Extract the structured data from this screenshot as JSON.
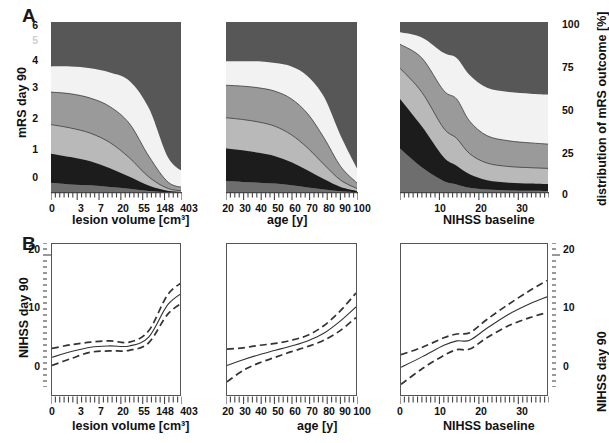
{
  "figure": {
    "panels": [
      {
        "letter": "A"
      },
      {
        "letter": "B"
      }
    ]
  },
  "panelA": {
    "letter": "A",
    "ylabel_left": "mRS day 90",
    "ylabel_right": "distribution of mRS outcome [%]",
    "ytick_left": [
      "6",
      "5",
      "4",
      "3",
      "2",
      "1",
      "0"
    ],
    "ytick_right": [
      "100",
      "75",
      "50",
      "25",
      "0"
    ],
    "subplots": [
      {
        "xlabel": "lesion volume [cm³]",
        "xticks": [
          "0",
          "3",
          "7",
          "20",
          "55",
          "148",
          "403"
        ]
      },
      {
        "xlabel": "age [y]",
        "xticks": [
          "20",
          "30",
          "40",
          "50",
          "60",
          "70",
          "80",
          "90",
          "100"
        ]
      },
      {
        "xlabel": "NIHSS baseline",
        "xticks": [
          "10",
          "20",
          "30"
        ]
      }
    ]
  },
  "panelB": {
    "letter": "B",
    "ylabel_left": "NIHSS day 90",
    "ylabel_right": "NIHSS day 90",
    "ytick_left": [
      "20",
      "10",
      "0"
    ],
    "ytick_right": [
      "20",
      "10",
      "0"
    ],
    "subplots": [
      {
        "xlabel": "lesion volume [cm³]",
        "xticks": [
          "0",
          "3",
          "7",
          "20",
          "55",
          "148",
          "403"
        ]
      },
      {
        "xlabel": "age [y]",
        "xticks": [
          "20",
          "30",
          "40",
          "50",
          "60",
          "70",
          "80",
          "90",
          "100"
        ]
      },
      {
        "xlabel": "NIHSS baseline",
        "xticks": [
          "0",
          "10",
          "20",
          "30"
        ]
      }
    ]
  },
  "colors": {
    "mrs0": "#6e6e6e",
    "mrs1": "#5a5a5a",
    "mrs2": "#1c1c1c",
    "mrs3": "#b9b9b9",
    "mrs4": "#9a9a9a",
    "mrs5": "#f2f2f2",
    "mrs6": "#575757",
    "frame": "#555555",
    "line": "#333333"
  },
  "chart_data": [
    {
      "id": "A1",
      "type": "area",
      "stacked": true,
      "title": "",
      "xlabel": "lesion volume [cm³]",
      "ylabel": "distribution of mRS outcome [%]",
      "xticks": [
        0,
        3,
        7,
        20,
        55,
        148,
        403
      ],
      "xscale": "log-like",
      "ylim": [
        0,
        100
      ],
      "yticks": [
        0,
        25,
        50,
        75,
        100
      ],
      "x": [
        0,
        3,
        7,
        20,
        55,
        148,
        403,
        700
      ],
      "series": [
        {
          "name": "mRS 0",
          "values": [
            6,
            5,
            4.5,
            3.5,
            2.5,
            1.2,
            0.4,
            0.2
          ]
        },
        {
          "name": "mRS 1",
          "values": [
            17,
            16,
            14,
            11,
            7,
            3,
            0.8,
            0.4
          ]
        },
        {
          "name": "mRS 2",
          "values": [
            17,
            17,
            16.5,
            15,
            11,
            5,
            1.3,
            0.6
          ]
        },
        {
          "name": "mRS 3",
          "values": [
            19,
            20,
            20.5,
            21,
            20,
            12,
            3.5,
            1.8
          ]
        },
        {
          "name": "mRS 4",
          "values": [
            15,
            16,
            17.5,
            20,
            25,
            28,
            14,
            8
          ]
        },
        {
          "name": "mRS 5",
          "values": [
            2.5,
            3,
            3.5,
            4.5,
            6.5,
            9,
            7,
            5
          ]
        },
        {
          "name": "mRS 6",
          "values": [
            23.5,
            23,
            23.5,
            25,
            28,
            41.8,
            73,
            84
          ]
        }
      ]
    },
    {
      "id": "A2",
      "type": "area",
      "stacked": true,
      "title": "",
      "xlabel": "age [y]",
      "ylabel": "distribution of mRS outcome [%]",
      "xticks": [
        20,
        30,
        40,
        50,
        60,
        70,
        80,
        90,
        100
      ],
      "xscale": "linear",
      "ylim": [
        0,
        100
      ],
      "yticks": [
        0,
        25,
        50,
        75,
        100
      ],
      "x": [
        20,
        30,
        40,
        50,
        60,
        70,
        80,
        90,
        100
      ],
      "series": [
        {
          "name": "mRS 0",
          "values": [
            7,
            6.5,
            6,
            5.5,
            4.5,
            3.2,
            2.0,
            1.0,
            0.4
          ]
        },
        {
          "name": "mRS 1",
          "values": [
            19,
            18.5,
            17.5,
            16,
            13.5,
            10,
            6,
            2.5,
            0.8
          ]
        },
        {
          "name": "mRS 2",
          "values": [
            18,
            18,
            18,
            17.5,
            16,
            13,
            8.5,
            4,
            1.4
          ]
        },
        {
          "name": "mRS 3",
          "values": [
            19,
            19.5,
            20,
            20.5,
            21,
            20,
            15.5,
            8,
            3.2
          ]
        },
        {
          "name": "mRS 4",
          "values": [
            14,
            14.5,
            15.5,
            16.5,
            19,
            22,
            24,
            18,
            8.5
          ]
        },
        {
          "name": "mRS 5",
          "values": [
            2.2,
            2.4,
            2.7,
            3.1,
            4.0,
            5.4,
            7.5,
            8.5,
            5.5
          ]
        },
        {
          "name": "mRS 6",
          "values": [
            20.8,
            20.6,
            20.3,
            20.9,
            22,
            26.4,
            36.5,
            58,
            80.2
          ]
        }
      ]
    },
    {
      "id": "A3",
      "type": "area",
      "stacked": true,
      "title": "",
      "xlabel": "NIHSS baseline",
      "ylabel": "distribution of mRS outcome [%]",
      "xticks": [
        10,
        20,
        30
      ],
      "xscale": "linear",
      "ylim": [
        0,
        100
      ],
      "yticks": [
        0,
        25,
        50,
        75,
        100
      ],
      "x": [
        0,
        5,
        10,
        13,
        16,
        20,
        25,
        30,
        34
      ],
      "series": [
        {
          "name": "mRS 0",
          "values": [
            26,
            15,
            7,
            5,
            3,
            2,
            1.5,
            1.3,
            1.2
          ]
        },
        {
          "name": "mRS 1",
          "values": [
            29,
            24,
            14,
            11,
            8,
            5.5,
            4.5,
            4.2,
            4.0
          ]
        },
        {
          "name": "mRS 2",
          "values": [
            18,
            20,
            17,
            16,
            12,
            10,
            9.5,
            9.3,
            9.2
          ]
        },
        {
          "name": "mRS 3",
          "values": [
            14,
            20,
            22,
            23,
            19,
            16,
            15,
            14.5,
            14.2
          ]
        },
        {
          "name": "mRS 4",
          "values": [
            7,
            12,
            22,
            24,
            27,
            28,
            28.5,
            28.8,
            29
          ]
        },
        {
          "name": "mRS 5",
          "values": [
            1.5,
            3,
            7,
            8,
            11,
            12.5,
            13,
            13,
            13
          ]
        },
        {
          "name": "mRS 6",
          "values": [
            4.5,
            6,
            11,
            13,
            20,
            26,
            28,
            28.9,
            29.4
          ]
        }
      ]
    },
    {
      "id": "B1",
      "type": "line",
      "title": "",
      "xlabel": "lesion volume [cm³]",
      "ylabel": "NIHSS day 90",
      "xticks": [
        0,
        3,
        7,
        20,
        55,
        148,
        403
      ],
      "xscale": "log-like",
      "ylim": [
        -3,
        21
      ],
      "yticks": [
        0,
        10,
        20
      ],
      "x": [
        0,
        3,
        7,
        20,
        55,
        148,
        403,
        700
      ],
      "series": [
        {
          "name": "fit",
          "values": [
            3.0,
            3.9,
            4.6,
            4.8,
            4.8,
            6.2,
            11.4,
            13.7
          ],
          "style": "solid"
        },
        {
          "name": "upper CI",
          "values": [
            4.4,
            5.0,
            5.4,
            5.6,
            5.4,
            7.2,
            13.0,
            15.4
          ],
          "style": "dashed"
        },
        {
          "name": "lower CI",
          "values": [
            1.7,
            2.8,
            3.8,
            4.0,
            4.1,
            5.3,
            9.9,
            12.1
          ],
          "style": "dashed"
        }
      ]
    },
    {
      "id": "B2",
      "type": "line",
      "title": "",
      "xlabel": "age [y]",
      "ylabel": "NIHSS day 90",
      "xticks": [
        20,
        30,
        40,
        50,
        60,
        70,
        80,
        90,
        100
      ],
      "xscale": "linear",
      "ylim": [
        -3,
        21
      ],
      "yticks": [
        0,
        10,
        20
      ],
      "x": [
        20,
        30,
        40,
        50,
        60,
        70,
        80,
        90,
        100
      ],
      "series": [
        {
          "name": "fit",
          "values": [
            1.7,
            2.6,
            3.4,
            4.1,
            4.8,
            5.6,
            6.8,
            8.7,
            11.0
          ],
          "style": "solid"
        },
        {
          "name": "upper CI",
          "values": [
            4.3,
            4.5,
            4.9,
            5.2,
            5.7,
            6.5,
            8.0,
            10.3,
            13.2
          ],
          "style": "dashed"
        },
        {
          "name": "lower CI",
          "values": [
            -0.9,
            0.9,
            2.1,
            3.0,
            3.9,
            4.7,
            5.7,
            7.2,
            9.3
          ],
          "style": "dashed"
        }
      ]
    },
    {
      "id": "B3",
      "type": "line",
      "title": "",
      "xlabel": "NIHSS baseline",
      "ylabel": "NIHSS day 90",
      "xticks": [
        0,
        10,
        20,
        30
      ],
      "xscale": "linear",
      "ylim": [
        -3,
        21
      ],
      "yticks": [
        0,
        10,
        20
      ],
      "x": [
        0,
        5,
        10,
        13,
        16,
        20,
        25,
        30,
        34
      ],
      "series": [
        {
          "name": "fit",
          "values": [
            1.4,
            3.1,
            4.9,
            5.6,
            5.7,
            7.6,
            9.8,
            11.5,
            12.6
          ],
          "style": "solid"
        },
        {
          "name": "upper CI",
          "values": [
            3.4,
            4.6,
            6.1,
            6.7,
            6.9,
            9.0,
            11.4,
            13.6,
            15.2
          ],
          "style": "dashed"
        },
        {
          "name": "lower CI",
          "values": [
            -1.3,
            1.2,
            3.3,
            4.2,
            4.3,
            6.1,
            8.0,
            9.3,
            10.1
          ],
          "style": "dashed"
        }
      ]
    }
  ]
}
